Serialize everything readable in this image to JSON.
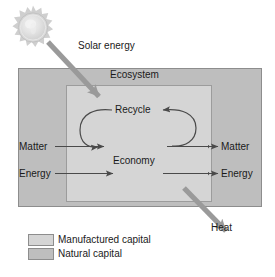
{
  "figure": {
    "type": "diagram",
    "background_color": "#ffffff"
  },
  "colors": {
    "natural_capital": "#bebebe",
    "manufactured_capital": "#d5d5d5",
    "box_stroke": "#8d8d8d",
    "thin_arrow": "#4a4a4a",
    "thick_arrow": "#9a9a9a",
    "sun_body": "#e2e2e2",
    "sun_corona": "#cfcfcf",
    "text": "#1a1a1a"
  },
  "icons": {
    "sun": "sun-icon"
  },
  "labels": {
    "solar_energy": "Solar energy",
    "ecosystem": "Ecosystem",
    "recycle": "Recycle",
    "economy": "Economy",
    "matter_in": "Matter",
    "energy_in": "Energy",
    "matter_out": "Matter",
    "energy_out": "Energy",
    "heat": "Heat"
  },
  "legend": {
    "items": [
      {
        "label": "Manufactured capital",
        "color": "#d5d5d5"
      },
      {
        "label": "Natural capital",
        "color": "#bebebe"
      }
    ]
  },
  "flows": {
    "inputs": [
      "Solar energy",
      "Matter",
      "Energy"
    ],
    "outputs": [
      "Matter",
      "Energy",
      "Heat"
    ],
    "internal": [
      "Recycle"
    ]
  }
}
